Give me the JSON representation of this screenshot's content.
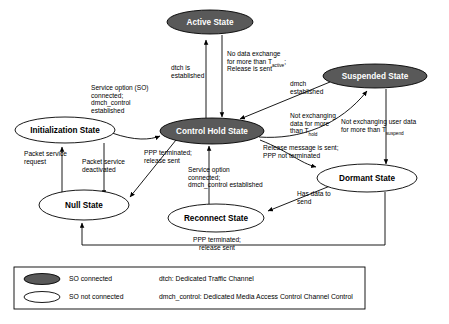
{
  "diagram": {
    "nodes": [
      {
        "id": "active",
        "label": "Active State",
        "style": "filled",
        "cx": 210,
        "cy": 22,
        "rx": 43,
        "ry": 12
      },
      {
        "id": "suspended",
        "label": "Suspended State",
        "style": "filled",
        "cx": 375,
        "cy": 76,
        "rx": 52,
        "ry": 12
      },
      {
        "id": "initialization",
        "label": "Initialization State",
        "style": "hollow",
        "cx": 65,
        "cy": 130,
        "rx": 50,
        "ry": 13
      },
      {
        "id": "control_hold",
        "label": "Control Hold State",
        "style": "filled",
        "cx": 212,
        "cy": 131,
        "rx": 52,
        "ry": 13
      },
      {
        "id": "dormant",
        "label": "Dormant State",
        "style": "hollow",
        "cx": 367,
        "cy": 178,
        "rx": 50,
        "ry": 14
      },
      {
        "id": "null",
        "label": "Null State",
        "style": "hollow",
        "cx": 84,
        "cy": 205,
        "rx": 45,
        "ry": 15
      },
      {
        "id": "reconnect",
        "label": "Reconnect State",
        "style": "hollow",
        "cx": 216,
        "cy": 218,
        "rx": 48,
        "ry": 14
      }
    ],
    "edge_labels": [
      {
        "id": "dtch-established",
        "x": 171,
        "y": 70,
        "align": "start",
        "lines": [
          {
            "text": "dtch is"
          },
          {
            "text": "established"
          }
        ]
      },
      {
        "id": "no-data-exchange-active",
        "x": 227,
        "y": 56,
        "align": "start",
        "lines": [
          {
            "text": "No data exchange"
          },
          {
            "text": "for more than T",
            "sub": "active",
            "after": ";"
          },
          {
            "text": "Release is sent"
          }
        ]
      },
      {
        "id": "dmch-established",
        "x": 290,
        "y": 86,
        "align": "start",
        "lines": [
          {
            "text": "dmch"
          },
          {
            "text": "established"
          }
        ]
      },
      {
        "id": "service-option-so-connected",
        "x": 91,
        "y": 90,
        "align": "start",
        "lines": [
          {
            "text": "Service option (SO)"
          },
          {
            "text": "connected;"
          },
          {
            "text": "dmch_control"
          },
          {
            "text": "established"
          }
        ]
      },
      {
        "id": "not-exchanging-data-hold",
        "x": 290,
        "y": 118,
        "align": "start",
        "lines": [
          {
            "text": "Not exchanging"
          },
          {
            "text": "data for more"
          },
          {
            "text": "than T",
            "sub": "hold"
          }
        ]
      },
      {
        "id": "not-exchanging-user-data-suspend",
        "x": 341,
        "y": 124,
        "align": "start",
        "lines": [
          {
            "text": "Not exchanging user data"
          },
          {
            "text": "for more than T",
            "sub": "suspend"
          }
        ]
      },
      {
        "id": "release-message-sent",
        "x": 263,
        "y": 150,
        "align": "start",
        "lines": [
          {
            "text": "Release message is sent;"
          },
          {
            "text": "PPP not terminated"
          }
        ]
      },
      {
        "id": "ppp-terminated-release-sent-hold",
        "x": 144,
        "y": 155,
        "align": "start",
        "lines": [
          {
            "text": "PPP terminated;"
          },
          {
            "text": "release sent"
          }
        ]
      },
      {
        "id": "packet-service-request",
        "x": 24,
        "y": 156,
        "align": "start",
        "lines": [
          {
            "text": "Packet service"
          },
          {
            "text": "request"
          }
        ]
      },
      {
        "id": "packet-service-deactivated",
        "x": 82,
        "y": 164,
        "align": "start",
        "lines": [
          {
            "text": "Packet service"
          },
          {
            "text": "deactivated"
          }
        ]
      },
      {
        "id": "service-option-connected-dmch",
        "x": 188,
        "y": 172,
        "align": "start",
        "lines": [
          {
            "text": "Service option"
          },
          {
            "text": "connected;"
          },
          {
            "text": "dmch_control established"
          }
        ]
      },
      {
        "id": "has-data-to-send",
        "x": 297,
        "y": 196,
        "align": "start",
        "lines": [
          {
            "text": "Has data to"
          },
          {
            "text": "send"
          }
        ]
      },
      {
        "id": "ppp-terminated-release-sent-bottom",
        "x": 217,
        "y": 242,
        "align": "middle",
        "lines": [
          {
            "text": "PPP terminated;"
          },
          {
            "text": "release sent"
          }
        ]
      }
    ],
    "legend": {
      "rows": [
        {
          "swatch": "filled",
          "label": "SO connected",
          "definition": "dtch: Dedicated Traffic Channel"
        },
        {
          "swatch": "hollow",
          "label": "SO not connected",
          "definition": "dmch_control: Dedicated Media Access Control Channel Control"
        }
      ]
    },
    "colors": {
      "filled_node": "#595959",
      "stroke": "#000000",
      "background": "#ffffff",
      "filled_label": "#ffffff"
    }
  }
}
